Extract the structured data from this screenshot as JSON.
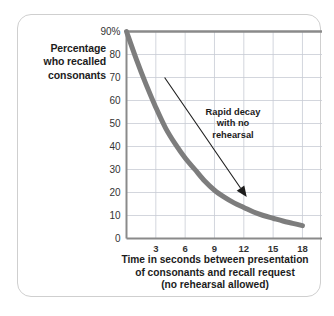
{
  "chart_data": {
    "type": "line",
    "title": "",
    "xlabel": "Time in seconds between presentation of consonants and recall request (no rehearsal allowed)",
    "xlabel_lines": [
      "Time in seconds between presentation",
      "of consonants and recall request",
      "(no rehearsal allowed)"
    ],
    "ylabel": "Percentage who recalled consonants",
    "ylabel_lines": [
      "Percentage",
      "who recalled",
      "consonants"
    ],
    "xlim": [
      0,
      20
    ],
    "ylim": [
      0,
      90
    ],
    "grid": true,
    "legend": null,
    "xticks": [
      3,
      6,
      9,
      12,
      15,
      18
    ],
    "xtick_labels": [
      "3",
      "6",
      "9",
      "12",
      "15",
      "18"
    ],
    "yticks": [
      0,
      10,
      20,
      30,
      40,
      50,
      60,
      70,
      80,
      90
    ],
    "ytick_labels": [
      "0",
      "10",
      "20",
      "30",
      "40",
      "50",
      "60",
      "70",
      "80",
      "90%"
    ],
    "series": [
      {
        "name": "Percentage recalled",
        "color": "#7d7d7d",
        "line_width": 5,
        "x": [
          0,
          1,
          2,
          3,
          4,
          5,
          6,
          7,
          8,
          9,
          10,
          11,
          12,
          13,
          14,
          15,
          16,
          17,
          18
        ],
        "y": [
          90,
          78,
          67,
          57,
          48,
          41,
          35,
          30,
          25,
          21,
          18,
          15.5,
          13.5,
          11.5,
          10,
          8.8,
          7.6,
          6.6,
          5.6
        ]
      }
    ],
    "annotations": [
      {
        "text": "Rapid decay with no rehearsal",
        "lines": [
          "Rapid decay",
          "with no",
          "rehearsal"
        ],
        "arrow_from": [
          3.9,
          70
        ],
        "arrow_to": [
          12.3,
          18
        ],
        "color": "#1c1c1c"
      }
    ],
    "colors": {
      "curve": "#7d7d7d",
      "grid": "#c8ccd4",
      "axis": "#8a8a8a",
      "text": "#1c1c1c",
      "tick_text": "#333333",
      "frame_border": "#cfcfcf",
      "background": "#ffffff",
      "arrow": "#1c1c1c"
    }
  }
}
